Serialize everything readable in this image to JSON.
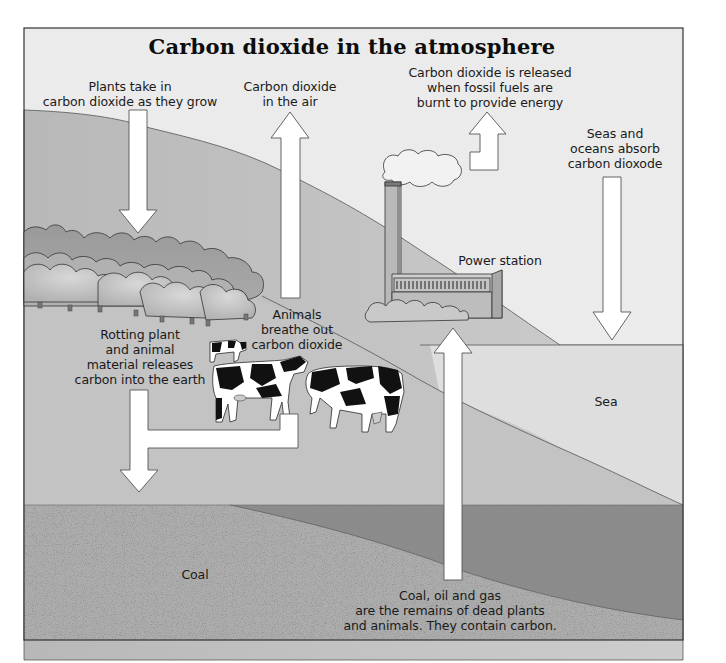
{
  "diagram": {
    "title": "Carbon dioxide in the atmosphere",
    "colors": {
      "sky": "#ececec",
      "hill_far": "#c9c9c9",
      "hill_near": "#bdbdbd",
      "sea": "#dcdcdc",
      "ground_light": "#a9a9a9",
      "ground_dark": "#8a8a8a",
      "arrow_fill": "#ffffff",
      "outline": "#4a4a4a"
    },
    "labels": {
      "plants_take_in": "Plants take in\ncarbon dioxide as they grow",
      "co2_in_air": "Carbon dioxide\nin the air",
      "fossil_fuels_release": "Carbon dioxide is released\nwhen fossil fuels are\nburnt to provide energy",
      "seas_absorb": "Seas and\noceans absorb\ncarbon dioxode",
      "power_station": "Power station",
      "animals_breathe": "Animals\nbreathe out\ncarbon dioxide",
      "rotting_material": "Rotting plant\nand animal\nmaterial releases\ncarbon into the earth",
      "sea": "Sea",
      "coal": "Coal",
      "fossil_fuels_origin": "Coal, oil and gas\nare the remains of dead plants\nand animals. They contain carbon."
    },
    "arrows": [
      {
        "id": "plants-absorb",
        "direction": "down",
        "meaning": "Plants take in carbon dioxide"
      },
      {
        "id": "air-co2",
        "direction": "up",
        "meaning": "Carbon dioxide in the air"
      },
      {
        "id": "power-emission",
        "direction": "up",
        "meaning": "Carbon dioxide released by burning fossil fuels"
      },
      {
        "id": "sea-absorb",
        "direction": "down",
        "meaning": "Seas and oceans absorb carbon dioxide"
      },
      {
        "id": "decay-to-earth",
        "direction": "down",
        "meaning": "Rotting material releases carbon into the earth"
      },
      {
        "id": "fossil-extraction",
        "direction": "up",
        "meaning": "Coal, oil and gas extracted to power station"
      }
    ]
  }
}
